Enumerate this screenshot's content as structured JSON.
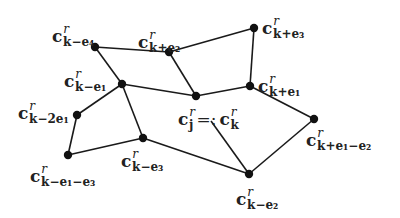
{
  "diagram": {
    "type": "lattice-graph",
    "nodes": [
      {
        "id": "k-e4",
        "x": 95,
        "y": 47,
        "label": {
          "base": "c",
          "sup": "r",
          "sub": "k−e₄"
        },
        "lx": 52,
        "ly": 18
      },
      {
        "id": "k+e2",
        "x": 169,
        "y": 52,
        "label": {
          "base": "c",
          "sup": "r",
          "sub": "k+e₂"
        },
        "lx": 138,
        "ly": 24
      },
      {
        "id": "k+e3",
        "x": 254,
        "y": 28,
        "label": {
          "base": "c",
          "sup": "r",
          "sub": "k+e₃"
        },
        "lx": 262,
        "ly": 10
      },
      {
        "id": "k-e1",
        "x": 122,
        "y": 84,
        "label": {
          "base": "c",
          "sup": "r",
          "sub": "k−e₁"
        },
        "lx": 64,
        "ly": 63
      },
      {
        "id": "k",
        "x": 196,
        "y": 96,
        "label": {
          "base": "c",
          "sup": "r",
          "sub": "j",
          "eq": "=:",
          "base2": "c",
          "sup2": "r",
          "sub2": "k"
        },
        "lx": 178,
        "ly": 101
      },
      {
        "id": "k+e1",
        "x": 250,
        "y": 86,
        "label": {
          "base": "c",
          "sup": "r",
          "sub": "k+e₁"
        },
        "lx": 258,
        "ly": 68
      },
      {
        "id": "k-2e1",
        "x": 77,
        "y": 115,
        "label": {
          "base": "c",
          "sup": "r",
          "sub": "k−2e₁"
        },
        "lx": 18,
        "ly": 95
      },
      {
        "id": "k-e1-e3",
        "x": 68,
        "y": 155,
        "label": {
          "base": "c",
          "sup": "r",
          "sub": "k−e₁−e₃"
        },
        "lx": 30,
        "ly": 158
      },
      {
        "id": "k-e3",
        "x": 143,
        "y": 138,
        "label": {
          "base": "c",
          "sup": "r",
          "sub": "k−e₃"
        },
        "lx": 121,
        "ly": 143
      },
      {
        "id": "k+e1-e2",
        "x": 314,
        "y": 119,
        "label": {
          "base": "c",
          "sup": "r",
          "sub": "k+e₁−e₂"
        },
        "lx": 306,
        "ly": 122
      },
      {
        "id": "k-e2",
        "x": 249,
        "y": 174,
        "label": {
          "base": "c",
          "sup": "r",
          "sub": "k−e₂"
        },
        "lx": 236,
        "ly": 181
      }
    ],
    "edges": [
      [
        "k-e4",
        "k+e2"
      ],
      [
        "k-e4",
        "k-e1"
      ],
      [
        "k+e2",
        "k+e3"
      ],
      [
        "k+e2",
        "k"
      ],
      [
        "k+e3",
        "k+e1"
      ],
      [
        "k-e1",
        "k"
      ],
      [
        "k-e1",
        "k-2e1"
      ],
      [
        "k-e1",
        "k-e3"
      ],
      [
        "k",
        "k+e1"
      ],
      [
        "k+e1",
        "k+e1-e2"
      ],
      [
        "k+e1-e2",
        "k-e2"
      ],
      [
        "k-e3",
        "k-e2"
      ],
      [
        "k-e3",
        "k-e1-e3"
      ],
      [
        "k-2e1",
        "k-e1-e3"
      ]
    ],
    "extra_lines": [
      {
        "from": [
          211,
          121
        ],
        "to": [
          249,
          174
        ],
        "note": "line from center label to k-e2"
      }
    ]
  }
}
